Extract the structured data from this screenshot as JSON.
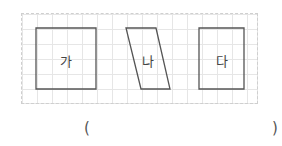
{
  "figure": {
    "grid": {
      "cell_size_px": 15,
      "line_color": "#e6e6e6"
    },
    "shapes": [
      {
        "id": "ga",
        "label": "가",
        "type": "rectangle",
        "points": [
          [
            36,
            28
          ],
          [
            96,
            28
          ],
          [
            96,
            89
          ],
          [
            36,
            89
          ]
        ]
      },
      {
        "id": "na",
        "label": "나",
        "type": "parallelogram",
        "points": [
          [
            126,
            28
          ],
          [
            156,
            28
          ],
          [
            170,
            89
          ],
          [
            141,
            89
          ]
        ]
      },
      {
        "id": "da",
        "label": "다",
        "type": "rectangle",
        "points": [
          [
            199,
            28
          ],
          [
            244,
            28
          ],
          [
            244,
            89
          ],
          [
            199,
            89
          ]
        ]
      }
    ],
    "stroke_color": "#555555"
  },
  "answer": {
    "open_paren": "(",
    "close_paren": ")",
    "value": ""
  }
}
